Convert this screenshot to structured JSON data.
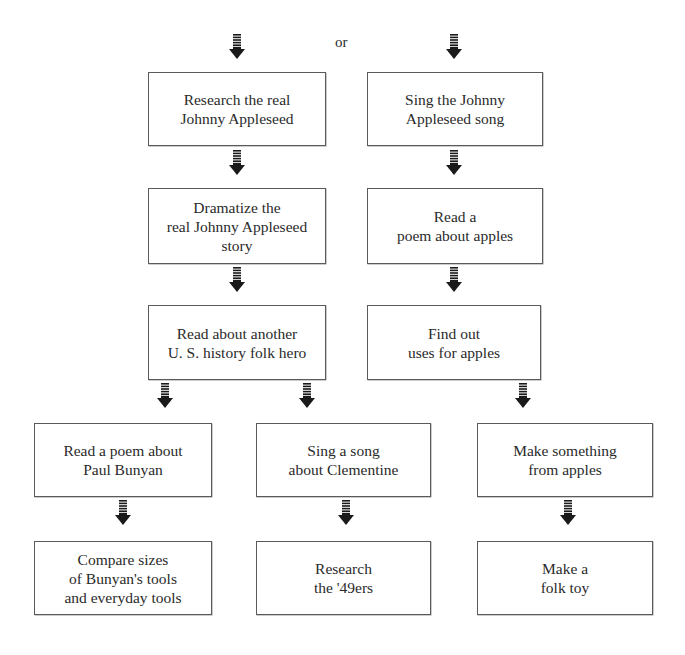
{
  "diagram": {
    "connector_label": "or",
    "colors": {
      "border": "#5a5a5a",
      "text": "#2a2a2a",
      "arrow": "#1a1a1a",
      "background": "#ffffff"
    },
    "nodes": [
      {
        "id": "research-real-johnny",
        "label": "Research the real\nJohnny Appleseed"
      },
      {
        "id": "sing-johnny-song",
        "label": "Sing the Johnny\nAppleseed song"
      },
      {
        "id": "dramatize-story",
        "label": "Dramatize the\nreal Johnny Appleseed\nstory"
      },
      {
        "id": "read-apple-poem",
        "label": "Read a\npoem about apples"
      },
      {
        "id": "read-folk-hero",
        "label": "Read about another\nU. S. history folk hero"
      },
      {
        "id": "find-apple-uses",
        "label": "Find out\nuses for apples"
      },
      {
        "id": "read-bunyan-poem",
        "label": "Read a poem about\nPaul Bunyan"
      },
      {
        "id": "sing-clementine",
        "label": "Sing a song\nabout Clementine"
      },
      {
        "id": "make-from-apples",
        "label": "Make something\nfrom apples"
      },
      {
        "id": "compare-tool-sizes",
        "label": "Compare sizes\nof Bunyan's tools\nand everyday tools"
      },
      {
        "id": "research-49ers",
        "label": "Research\nthe '49ers"
      },
      {
        "id": "make-folk-toy",
        "label": "Make a\nfolk toy"
      }
    ],
    "edges": [
      {
        "from": "start",
        "to": "research-real-johnny"
      },
      {
        "from": "start",
        "to": "sing-johnny-song"
      },
      {
        "from": "research-real-johnny",
        "to": "dramatize-story"
      },
      {
        "from": "sing-johnny-song",
        "to": "read-apple-poem"
      },
      {
        "from": "dramatize-story",
        "to": "read-folk-hero"
      },
      {
        "from": "read-apple-poem",
        "to": "find-apple-uses"
      },
      {
        "from": "read-folk-hero",
        "to": "read-bunyan-poem"
      },
      {
        "from": "read-folk-hero",
        "to": "sing-clementine"
      },
      {
        "from": "find-apple-uses",
        "to": "make-from-apples"
      },
      {
        "from": "read-bunyan-poem",
        "to": "compare-tool-sizes"
      },
      {
        "from": "sing-clementine",
        "to": "research-49ers"
      },
      {
        "from": "make-from-apples",
        "to": "make-folk-toy"
      }
    ]
  }
}
